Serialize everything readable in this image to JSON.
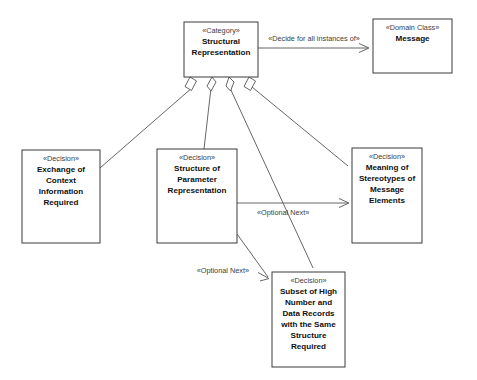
{
  "diagram": {
    "type": "uml-class-diagram",
    "background_color": "#ffffff",
    "line_color": "#555555",
    "text_color": "#1a1a1a",
    "nodes": [
      {
        "id": "category",
        "stereotype": "«Category»",
        "name_lines": [
          "Structural",
          "Representation"
        ],
        "x": 184,
        "y": 22,
        "w": 74,
        "h": 55
      },
      {
        "id": "domain-class",
        "stereotype": "«Domain Class»",
        "name_lines": [
          "Message"
        ],
        "x": 373,
        "y": 19,
        "w": 79,
        "h": 54
      },
      {
        "id": "decision-exchange",
        "stereotype": "«Decision»",
        "name_lines": [
          "Exchange of",
          "Context",
          "Information",
          "Required"
        ],
        "x": 22,
        "y": 150,
        "w": 78,
        "h": 93
      },
      {
        "id": "decision-structure",
        "stereotype": "«Decision»",
        "name_lines": [
          "Structure of",
          "Parameter",
          "Representation"
        ],
        "x": 157,
        "y": 149,
        "w": 80,
        "h": 94
      },
      {
        "id": "decision-meaning",
        "stereotype": "«Decision»",
        "name_lines": [
          "Meaning of",
          "Stereotypes of",
          "Message",
          "Elements"
        ],
        "x": 352,
        "y": 148,
        "w": 70,
        "h": 95
      },
      {
        "id": "decision-subset",
        "stereotype": "«Decision»",
        "name_lines": [
          "Subset of High",
          "Number and",
          "Data Records",
          "with the Same",
          "Structure",
          "Required"
        ],
        "x": 272,
        "y": 272,
        "w": 73,
        "h": 95
      }
    ],
    "edges": [
      {
        "id": "edge-decide-for-all-instances",
        "label": "«Decide for all instances of»",
        "from": "category",
        "to": "domain-class",
        "arrow": "open",
        "label_x": 314,
        "label_y": 40
      },
      {
        "id": "edge-optional-next-meaning",
        "label": "«Optional Next»",
        "from": "decision-structure",
        "to": "decision-meaning",
        "arrow": "open",
        "label_x": 256,
        "label_y": 212
      },
      {
        "id": "edge-optional-next-subset",
        "label": "«Optional Next»",
        "from": "decision-structure",
        "to": "decision-subset",
        "arrow": "open",
        "label_x": 193,
        "label_y": 272
      },
      {
        "id": "edge-aggregation-exchange",
        "label": "",
        "from": "category",
        "to": "decision-exchange",
        "arrow": "aggregation-diamond"
      },
      {
        "id": "edge-aggregation-structure",
        "label": "",
        "from": "category",
        "to": "decision-structure",
        "arrow": "aggregation-diamond"
      },
      {
        "id": "edge-aggregation-subset",
        "label": "",
        "from": "category",
        "to": "decision-subset",
        "arrow": "aggregation-diamond"
      },
      {
        "id": "edge-aggregation-meaning",
        "label": "",
        "from": "category",
        "to": "decision-meaning",
        "arrow": "aggregation-diamond"
      }
    ]
  },
  "labels": {
    "category_stereotype": "«Category»",
    "category_l1": "Structural",
    "category_l2": "Representation",
    "domain_stereotype": "«Domain Class»",
    "domain_l1": "Message",
    "exchange_stereotype": "«Decision»",
    "exchange_l1": "Exchange of",
    "exchange_l2": "Context",
    "exchange_l3": "Information",
    "exchange_l4": "Required",
    "structure_stereotype": "«Decision»",
    "structure_l1": "Structure of",
    "structure_l2": "Parameter",
    "structure_l3": "Representation",
    "meaning_stereotype": "«Decision»",
    "meaning_l1": "Meaning of",
    "meaning_l2": "Stereotypes of",
    "meaning_l3": "Message",
    "meaning_l4": "Elements",
    "subset_stereotype": "«Decision»",
    "subset_l1": "Subset of High",
    "subset_l2": "Number and",
    "subset_l3": "Data Records",
    "subset_l4": "with the Same",
    "subset_l5": "Structure",
    "subset_l6": "Required",
    "edge_decide": "«Decide for all instances of»",
    "edge_optional_next_1": "«Optional Next»",
    "edge_optional_next_2": "«Optional Next»"
  }
}
